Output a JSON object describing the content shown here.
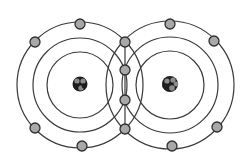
{
  "diagram": {
    "type": "covalent-bond-electron-shell-diagram",
    "background": "#ffffff",
    "colors": {
      "stroke": "#3a3a3a",
      "electron_fill": "#a8a8a8",
      "electron_stroke": "#2e2e2e",
      "nucleus_dark": "#1e1e1e",
      "nucleus_light": "#8c8c8c"
    },
    "atoms": [
      {
        "name": "left-atom",
        "center": [
          80,
          85
        ],
        "shell_radii": [
          33,
          47,
          63
        ],
        "outer_electrons": [
          [
            80,
            24
          ],
          [
            35,
            42
          ],
          [
            35,
            128
          ],
          [
            82,
            146
          ]
        ]
      },
      {
        "name": "right-atom",
        "center": [
          170,
          85
        ],
        "shell_radii": [
          34,
          48,
          64
        ],
        "outer_electrons": [
          [
            170,
            24
          ],
          [
            214,
            41
          ],
          [
            217,
            127
          ],
          [
            172,
            146
          ]
        ]
      }
    ],
    "shared_electrons": [
      [
        125,
        42
      ],
      [
        125,
        70
      ],
      [
        125,
        100
      ],
      [
        125,
        129
      ]
    ],
    "bond_line": {
      "x": 125,
      "y1": 42,
      "y2": 129
    },
    "electron_radius": 5
  }
}
